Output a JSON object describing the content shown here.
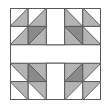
{
  "diagram": {
    "type": "quilt-block",
    "grid": {
      "rows": 5,
      "cols": 5
    },
    "colors": {
      "background": "#ffffff",
      "light": "#b4b4b4",
      "dark": "#8a8a8a",
      "white": "#ffffff",
      "line": "#5a5a5a"
    },
    "cells": [
      {
        "r": 0,
        "c": 0,
        "diag": "bl-tr",
        "a": "white",
        "b": "light"
      },
      {
        "r": 0,
        "c": 1,
        "diag": "bl-tr",
        "a": "white",
        "b": "light"
      },
      {
        "r": 1,
        "c": 0,
        "diag": "bl-tr",
        "a": "white",
        "b": "light"
      },
      {
        "r": 1,
        "c": 1,
        "diag": "bl-tr",
        "a": "dark",
        "b": "light"
      },
      {
        "r": 0,
        "c": 3,
        "diag": "tl-br",
        "a": "white",
        "b": "light"
      },
      {
        "r": 0,
        "c": 4,
        "diag": "tl-br",
        "a": "white",
        "b": "light"
      },
      {
        "r": 1,
        "c": 3,
        "diag": "tl-br",
        "a": "dark",
        "b": "light"
      },
      {
        "r": 1,
        "c": 4,
        "diag": "tl-br",
        "a": "white",
        "b": "light"
      },
      {
        "r": 3,
        "c": 0,
        "diag": "tl-br",
        "a": "light",
        "b": "white"
      },
      {
        "r": 3,
        "c": 1,
        "diag": "tl-br",
        "a": "light",
        "b": "dark"
      },
      {
        "r": 4,
        "c": 0,
        "diag": "tl-br",
        "a": "light",
        "b": "white"
      },
      {
        "r": 4,
        "c": 1,
        "diag": "tl-br",
        "a": "light",
        "b": "white"
      },
      {
        "r": 3,
        "c": 3,
        "diag": "bl-tr",
        "a": "light",
        "b": "dark"
      },
      {
        "r": 3,
        "c": 4,
        "diag": "bl-tr",
        "a": "light",
        "b": "white"
      },
      {
        "r": 4,
        "c": 3,
        "diag": "bl-tr",
        "a": "light",
        "b": "white"
      },
      {
        "r": 4,
        "c": 4,
        "diag": "bl-tr",
        "a": "light",
        "b": "white"
      }
    ],
    "sashing": {
      "center_row": 2,
      "center_col": 2,
      "fill": "white"
    }
  }
}
